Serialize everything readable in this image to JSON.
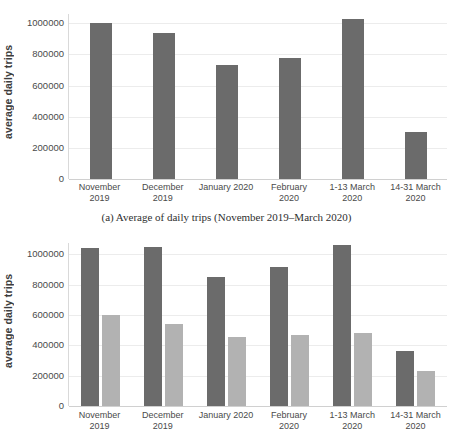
{
  "figure": {
    "caption_a": "(a) Average of daily trips (November 2019–March 2020)"
  },
  "chart_data": [
    {
      "id": "chart-a",
      "type": "bar",
      "title": "",
      "xlabel": "",
      "ylabel": "average daily trips",
      "ylim": [
        0,
        1060000
      ],
      "yticks": [
        0,
        200000,
        400000,
        600000,
        800000,
        1000000
      ],
      "ytick_labels": [
        "0",
        "200000",
        "400000",
        "600000",
        "800000",
        "1000000"
      ],
      "grid": true,
      "legend": "none",
      "categories": [
        "November\n2019",
        "December\n2019",
        "January 2020",
        "February\n2020",
        "1-13  March\n2020",
        "14-31 March\n2020"
      ],
      "series": [
        {
          "name": "average daily trips",
          "color": "#6b6b6b",
          "values": [
            1000000,
            940000,
            735000,
            780000,
            1030000,
            300000
          ]
        }
      ]
    },
    {
      "id": "chart-b",
      "type": "bar",
      "title": "",
      "xlabel": "",
      "ylabel": "average daily trips",
      "ylim": [
        0,
        1075000
      ],
      "yticks": [
        0,
        200000,
        400000,
        600000,
        800000,
        1000000
      ],
      "ytick_labels": [
        "0",
        "200000",
        "400000",
        "600000",
        "800000",
        "1000000"
      ],
      "grid": true,
      "legend": "none",
      "categories": [
        "November\n2019",
        "December\n2019",
        "January 2020",
        "February\n2020",
        "1-13  March\n2020",
        "14-31 March\n2020"
      ],
      "series": [
        {
          "name": "series-1",
          "color": "#6b6b6b",
          "values": [
            1045000,
            1050000,
            850000,
            915000,
            1060000,
            365000
          ]
        },
        {
          "name": "series-2",
          "color": "#b2b2b2",
          "values": [
            598000,
            540000,
            455000,
            470000,
            480000,
            232000
          ]
        }
      ]
    }
  ]
}
